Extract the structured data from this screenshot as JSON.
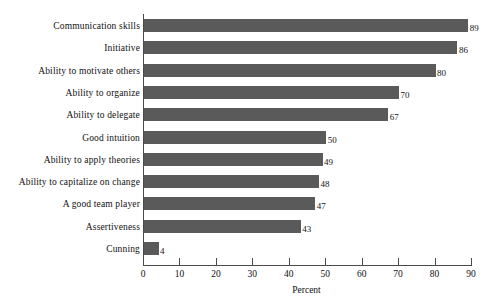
{
  "chart_data": {
    "type": "bar",
    "orientation": "horizontal",
    "title": "",
    "xlabel": "Percent",
    "ylabel": "",
    "categories": [
      "Communication skills",
      "Initiative",
      "Ability to motivate others",
      "Ability to organize",
      "Ability to delegate",
      "Good intuition",
      "Ability to apply theories",
      "Ability to capitalize on change",
      "A good team player",
      "Assertiveness",
      "Cunning"
    ],
    "values": [
      89,
      86,
      80,
      70,
      67,
      50,
      49,
      48,
      47,
      43,
      4
    ],
    "value_labels": [
      "89",
      "86",
      "80",
      "70",
      "67",
      "50",
      "49",
      "48",
      "47",
      "43",
      "4"
    ],
    "xlim": [
      0,
      90
    ],
    "xticks": [
      0,
      10,
      20,
      30,
      40,
      50,
      60,
      70,
      80,
      90
    ],
    "xtick_labels": [
      "0",
      "10",
      "20",
      "30",
      "40",
      "50",
      "60",
      "70",
      "80",
      "90"
    ],
    "grid": false,
    "legend": false,
    "bar_color": "#5a5a5a",
    "axis_color": "#4a4a4a",
    "background_color": "#ffffff"
  }
}
